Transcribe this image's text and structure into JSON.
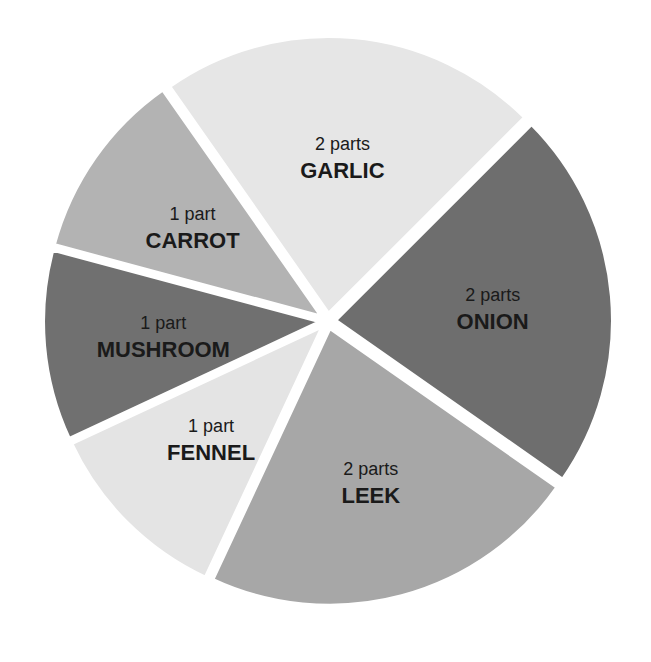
{
  "chart_data": {
    "type": "pie",
    "title": "",
    "unit": "parts",
    "total_parts": 9,
    "start_angle_deg": 235,
    "direction": "clockwise",
    "slices": [
      {
        "name": "GARLIC",
        "amount_label": "2 parts",
        "value": 2,
        "color": "#e6e6e6"
      },
      {
        "name": "ONION",
        "amount_label": "2 parts",
        "value": 2,
        "color": "#6e6e6e"
      },
      {
        "name": "LEEK",
        "amount_label": "2 parts",
        "value": 2,
        "color": "#a7a7a7"
      },
      {
        "name": "FENNEL",
        "amount_label": "1 part",
        "value": 1,
        "color": "#e4e4e4"
      },
      {
        "name": "MUSHROOM",
        "amount_label": "1 part",
        "value": 1,
        "color": "#707070"
      },
      {
        "name": "CARROT",
        "amount_label": "1 part",
        "value": 1,
        "color": "#b3b3b3"
      }
    ],
    "legend": "none",
    "labels_inside": true
  },
  "layout": {
    "cx": 328,
    "cy": 321,
    "radius": 285,
    "gap": 7,
    "label_radius_ratio": 0.58
  }
}
